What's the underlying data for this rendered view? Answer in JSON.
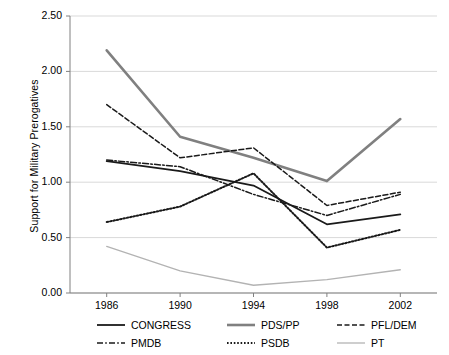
{
  "chart_data": {
    "type": "line",
    "title": "",
    "xlabel": "",
    "ylabel": "Support for Military Prerogatives",
    "categories": [
      "1986",
      "1990",
      "1994",
      "1998",
      "2002"
    ],
    "x": [
      1986,
      1990,
      1994,
      1998,
      2002
    ],
    "xlim": [
      1984,
      2004
    ],
    "ylim": [
      0.0,
      2.5
    ],
    "yticks": [
      "0.00",
      "0.50",
      "1.00",
      "1.50",
      "2.00",
      "2.50"
    ],
    "ytick_values": [
      0.0,
      0.5,
      1.0,
      1.5,
      2.0,
      2.5
    ],
    "grid": "horizontal",
    "legend_position": "bottom",
    "series": [
      {
        "name": "CONGRESS",
        "values": [
          1.19,
          1.1,
          0.97,
          0.62,
          0.71
        ],
        "style": "solid",
        "color": "#1a1a1a",
        "width": 1.8
      },
      {
        "name": "PDS/PP",
        "values": [
          2.19,
          1.41,
          1.22,
          1.01,
          1.57
        ],
        "style": "solid",
        "color": "#808080",
        "width": 2.6
      },
      {
        "name": "PFL/DEM",
        "values": [
          1.7,
          1.22,
          1.31,
          0.79,
          0.91
        ],
        "style": "dashed",
        "color": "#1a1a1a",
        "width": 1.5
      },
      {
        "name": "PMDB",
        "values": [
          1.2,
          1.14,
          0.89,
          0.7,
          0.89
        ],
        "style": "dashdot",
        "color": "#1a1a1a",
        "width": 1.5
      },
      {
        "name": "PSDB",
        "values": [
          0.64,
          0.78,
          1.08,
          0.41,
          0.57
        ],
        "style": "dotted",
        "color": "#1a1a1a",
        "width": 2.0
      },
      {
        "name": "PT",
        "values": [
          0.42,
          0.2,
          0.07,
          0.12,
          0.21
        ],
        "style": "solid",
        "color": "#b3b3b3",
        "width": 1.3
      }
    ]
  },
  "legend": {
    "entries": [
      {
        "label": "CONGRESS",
        "swatch": "legend-line-congress"
      },
      {
        "label": "PDS/PP",
        "swatch": "legend-line-pdspp"
      },
      {
        "label": "PFL/DEM",
        "swatch": "legend-line-pfldem"
      },
      {
        "label": "PMDB",
        "swatch": "legend-line-pmdb"
      },
      {
        "label": "PSDB",
        "swatch": "legend-line-psdb"
      },
      {
        "label": "PT",
        "swatch": "legend-line-pt"
      }
    ]
  },
  "axes": {
    "y_title": "Support for Military Prerogatives"
  },
  "colors": {
    "grid": "#d9d9d9",
    "axis": "#808080",
    "text": "#000000",
    "series_dark": "#1a1a1a",
    "series_gray": "#808080",
    "series_light": "#b3b3b3"
  }
}
